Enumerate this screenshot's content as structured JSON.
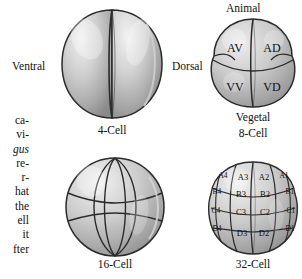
{
  "figure": {
    "kind": "embryo-cleavage-stages-diagram",
    "background": "#ffffff",
    "outline_color": "#2b2b2b",
    "cell_light": "#ededed",
    "cell_mid": "#b9b9b9",
    "cell_dark": "#8a8a8a"
  },
  "caption_column": {
    "lines": [
      {
        "text": "ca-",
        "italic": false
      },
      {
        "text": "vi-",
        "italic": false
      },
      {
        "text": "gus",
        "italic": true
      },
      {
        "text": "re-",
        "italic": false
      },
      {
        "text": "r-",
        "italic": false
      },
      {
        "text": "hat",
        "italic": false
      },
      {
        "text": "the",
        "italic": false
      },
      {
        "text": "ell",
        "italic": false
      },
      {
        "text": "it",
        "italic": false
      },
      {
        "text": "fter",
        "italic": false
      }
    ]
  },
  "panels": {
    "four_cell": {
      "caption": "4-Cell",
      "left_label": "Ventral",
      "right_label": "Dorsal"
    },
    "eight_cell": {
      "caption": "8-Cell",
      "top_label": "Animal",
      "bottom_label": "Vegetal",
      "quadrants": [
        {
          "name": "AV",
          "position": "animal-ventral"
        },
        {
          "name": "AD",
          "position": "animal-dorsal"
        },
        {
          "name": "VV",
          "position": "vegetal-ventral"
        },
        {
          "name": "VD",
          "position": "vegetal-dorsal"
        }
      ]
    },
    "sixteen_cell": {
      "caption": "16-Cell",
      "labels": []
    },
    "thirtytwo_cell": {
      "caption": "32-Cell",
      "tiers": [
        {
          "tier": "A",
          "cells": [
            "A4",
            "A3",
            "A2",
            "A1"
          ]
        },
        {
          "tier": "B",
          "cells": [
            "B4",
            "B3",
            "B2",
            "B1"
          ]
        },
        {
          "tier": "C",
          "cells": [
            "C4",
            "C3",
            "C2",
            "C1"
          ]
        },
        {
          "tier": "D",
          "cells": [
            "D4",
            "D3",
            "D2",
            "D1"
          ]
        }
      ]
    }
  }
}
